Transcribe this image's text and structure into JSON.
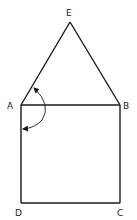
{
  "diagram": {
    "type": "geometry-figure",
    "colors": {
      "stroke": "#1a1a1a",
      "background": "#ffffff"
    },
    "points": {
      "A": {
        "label": "A",
        "x": 21,
        "y": 105
      },
      "B": {
        "label": "B",
        "x": 120,
        "y": 105
      },
      "C": {
        "label": "C",
        "x": 120,
        "y": 203
      },
      "D": {
        "label": "D",
        "x": 21,
        "y": 203
      },
      "E": {
        "label": "E",
        "x": 70,
        "y": 22
      }
    },
    "segments": [
      "AE",
      "EB",
      "AB",
      "BC",
      "CD",
      "DA"
    ],
    "annotations": [
      {
        "type": "curved-arrow",
        "at": "A",
        "from": "AE",
        "to": "AD",
        "arrowheads": "both"
      }
    ]
  }
}
